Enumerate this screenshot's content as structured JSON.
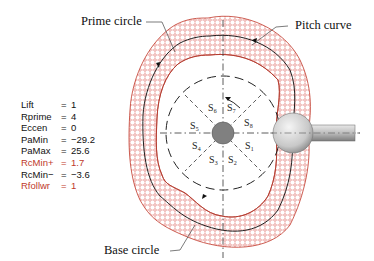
{
  "parameters": [
    {
      "name": "Lift",
      "eq": "=",
      "value": "1",
      "highlight": false
    },
    {
      "name": "Rprime",
      "eq": "=",
      "value": "4",
      "highlight": false
    },
    {
      "name": "Eccen",
      "eq": "=",
      "value": "0",
      "highlight": false
    },
    {
      "name": "PaMin",
      "eq": "=",
      "value": "−29.2",
      "highlight": false
    },
    {
      "name": "PaMax",
      "eq": "=",
      "value": "25.6",
      "highlight": false
    },
    {
      "name": "RcMin+",
      "eq": "=",
      "value": "1.7",
      "highlight": true
    },
    {
      "name": "RcMin−",
      "eq": "=",
      "value": "−3.6",
      "highlight": false
    },
    {
      "name": "Rfollwr",
      "eq": "=",
      "value": "1",
      "highlight": true
    }
  ],
  "callouts": {
    "prime_circle": "Prime circle",
    "pitch_curve": "Pitch curve",
    "base_circle": "Base circle"
  },
  "segments": {
    "s1": "S₁",
    "s2": "S₂",
    "s3": "S₃",
    "s4": "S₄",
    "s5": "S₅",
    "s6": "S₆",
    "s7": "S₇",
    "s8": "S₈"
  },
  "colors": {
    "band": "#d9534f",
    "highlight_text": "#c0392b",
    "hub": "#808080"
  }
}
